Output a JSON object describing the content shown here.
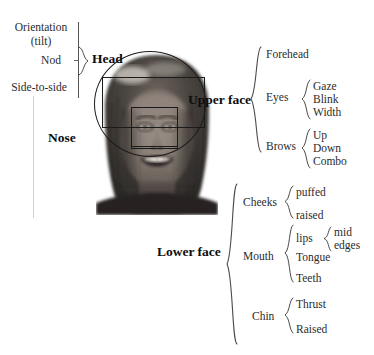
{
  "figure": {
    "type": "annotated-diagram"
  },
  "head_group": {
    "label": "Head",
    "items": [
      {
        "label": "Orientation"
      },
      {
        "label": "(tilt)"
      },
      {
        "label": "Nod"
      },
      {
        "label": "Side-to-side"
      }
    ]
  },
  "nose_group": {
    "label": "Nose"
  },
  "upper_face": {
    "label": "Upper face",
    "children": [
      {
        "label": "Forehead",
        "children": []
      },
      {
        "label": "Eyes",
        "children": [
          {
            "label": "Gaze"
          },
          {
            "label": "Blink"
          },
          {
            "label": "Width"
          }
        ]
      },
      {
        "label": "Brows",
        "children": [
          {
            "label": "Up"
          },
          {
            "label": "Down"
          },
          {
            "label": "Combo"
          }
        ]
      }
    ]
  },
  "lower_face": {
    "label": "Lower face",
    "children": [
      {
        "label": "Cheeks",
        "children": [
          {
            "label": "puffed"
          },
          {
            "label": "raised"
          }
        ]
      },
      {
        "label": "Mouth",
        "children": [
          {
            "label": "lips"
          },
          {
            "label": "Tongue"
          },
          {
            "label": "Teeth"
          }
        ],
        "lips_children": [
          {
            "label": "mid"
          },
          {
            "label": "edges"
          }
        ]
      },
      {
        "label": "Chin",
        "children": [
          {
            "label": "Thrust"
          },
          {
            "label": "Raised"
          }
        ]
      }
    ]
  },
  "overlays": {
    "head_outline": "head-circle-overlay",
    "upper_face_box": "upper-face-roi-box",
    "nose_box": "nose-roi-box",
    "mouth_box": "mouth-roi-box"
  },
  "colors": {
    "ink": "#1a1a1a",
    "rule": "#555555",
    "faint_rule": "#cfcfcf",
    "roi_stroke": "#1b1b1b",
    "background": "#ffffff"
  }
}
